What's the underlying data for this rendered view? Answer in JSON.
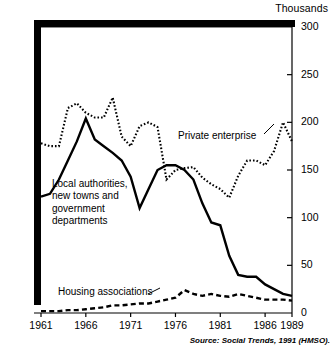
{
  "chart_data": {
    "type": "line",
    "title": "",
    "unit_label": "Thousands",
    "xlabel": "",
    "ylabel": "",
    "xlim": [
      1961,
      1989
    ],
    "ylim": [
      0,
      300
    ],
    "grid": false,
    "legend_position": "inline-annotations",
    "x_ticks": [
      "1961",
      "1966",
      "1971",
      "1976",
      "1981",
      "1986",
      "1989"
    ],
    "x_tick_values": [
      1961,
      1966,
      1971,
      1976,
      1981,
      1986,
      1989
    ],
    "y_ticks": [
      "0",
      "50",
      "100",
      "150",
      "200",
      "250",
      "300"
    ],
    "y_tick_values": [
      0,
      50,
      100,
      150,
      200,
      250,
      300
    ],
    "x": [
      1961,
      1962,
      1963,
      1964,
      1965,
      1966,
      1967,
      1968,
      1969,
      1970,
      1971,
      1972,
      1973,
      1974,
      1975,
      1976,
      1977,
      1978,
      1979,
      1980,
      1981,
      1982,
      1983,
      1984,
      1985,
      1986,
      1987,
      1988,
      1989
    ],
    "series": [
      {
        "name": "Private enterprise",
        "style": "dotted",
        "values": [
          178,
          175,
          175,
          215,
          220,
          210,
          205,
          205,
          226,
          185,
          175,
          196,
          200,
          195,
          140,
          150,
          152,
          153,
          142,
          135,
          130,
          121,
          144,
          160,
          160,
          155,
          170,
          200,
          180
        ]
      },
      {
        "name": "Local authorities, new towns and government departments",
        "style": "solid",
        "values": [
          122,
          125,
          140,
          160,
          180,
          204,
          182,
          175,
          168,
          160,
          143,
          110,
          130,
          150,
          155,
          155,
          150,
          140,
          115,
          95,
          92,
          60,
          40,
          38,
          38,
          30,
          25,
          20,
          18
        ]
      },
      {
        "name": "Housing associations",
        "style": "dashed",
        "values": [
          2,
          2,
          2,
          3,
          3,
          4,
          5,
          6,
          8,
          8,
          9,
          10,
          10,
          12,
          14,
          16,
          24,
          20,
          18,
          20,
          18,
          17,
          20,
          18,
          16,
          14,
          14,
          14,
          13
        ]
      }
    ],
    "annotations": [
      {
        "text": "Private enterprise",
        "series": "Private enterprise"
      },
      {
        "text": "Local authorities,",
        "series": "Local authorities"
      },
      {
        "text": "new towns and",
        "series": "Local authorities"
      },
      {
        "text": "government",
        "series": "Local authorities"
      },
      {
        "text": "departments",
        "series": "Local authorities"
      },
      {
        "text": "Housing associations",
        "series": "Housing associations"
      }
    ],
    "source": "Source: Social Trends, 1991 (HMSO)."
  },
  "labels": {
    "unit": "Thousands",
    "private_enterprise": "Private enterprise",
    "local_auth_line1": "Local authorities,",
    "local_auth_line2": "new towns and",
    "local_auth_line3": "government",
    "local_auth_line4": "departments",
    "housing_associations": "Housing associations",
    "source": "Source: Social Trends, 1991 (HMSO)."
  },
  "colors": {
    "ink": "#000000",
    "background": "#ffffff"
  }
}
